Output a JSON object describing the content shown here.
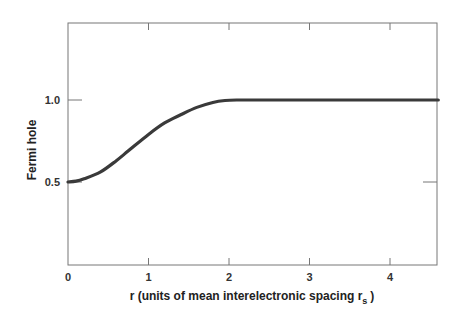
{
  "chart_data": {
    "type": "line",
    "title": "",
    "xlabel": "r (units of mean interelectronic spacing r",
    "xlabel_subscript": "s",
    "xlabel_close": ")",
    "ylabel": "Fermi hole",
    "xlim": [
      0,
      4.6
    ],
    "ylim": [
      0,
      1.47
    ],
    "grid": false,
    "x_ticks": [
      0,
      1,
      2,
      3,
      4
    ],
    "x_tick_labels": [
      "0",
      "1",
      "2",
      "3",
      "4"
    ],
    "y_ticks": [
      0.5,
      1.0
    ],
    "y_tick_labels": [
      "0.5",
      "1.0"
    ],
    "series": [
      {
        "name": "Fermi hole",
        "color": "#3a3a3a",
        "x": [
          0,
          0.1,
          0.2,
          0.4,
          0.6,
          0.75,
          1.0,
          1.2,
          1.4,
          1.6,
          1.8,
          1.95,
          2.1,
          2.5,
          3.0,
          3.5,
          4.0,
          4.6
        ],
        "y": [
          0.5,
          0.505,
          0.52,
          0.56,
          0.63,
          0.69,
          0.79,
          0.86,
          0.91,
          0.955,
          0.985,
          0.997,
          1.0,
          1.0,
          1.0,
          1.0,
          1.0,
          1.0
        ]
      }
    ]
  }
}
